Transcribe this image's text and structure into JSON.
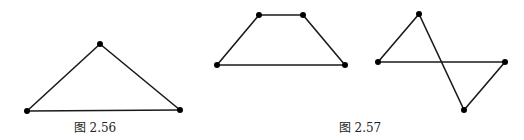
{
  "figures": [
    {
      "id": "fig-2-56",
      "caption": "图 2.56",
      "caption_pos": [
        95,
        132
      ],
      "shapes": [
        {
          "name": "triangle",
          "vertices": [
            [
              27,
              111
            ],
            [
              100,
              44
            ],
            [
              180,
              110
            ]
          ],
          "edges": [
            [
              0,
              1
            ],
            [
              1,
              2
            ],
            [
              0,
              2
            ]
          ]
        }
      ]
    },
    {
      "id": "fig-2-57",
      "caption": "图 2.57",
      "caption_pos": [
        360,
        132
      ],
      "shapes": [
        {
          "name": "trapezoid",
          "vertices": [
            [
              217,
              65
            ],
            [
              259,
              15
            ],
            [
              303,
              15
            ],
            [
              345,
              65
            ]
          ],
          "edges": [
            [
              0,
              1
            ],
            [
              1,
              2
            ],
            [
              2,
              3
            ],
            [
              0,
              3
            ]
          ]
        },
        {
          "name": "crossed-quadrilateral",
          "vertices": [
            [
              378,
              62
            ],
            [
              419,
              14
            ],
            [
              464,
              110
            ],
            [
              505,
              62
            ]
          ],
          "edges": [
            [
              0,
              1
            ],
            [
              1,
              2
            ],
            [
              2,
              3
            ],
            [
              0,
              3
            ]
          ]
        }
      ]
    }
  ],
  "style": {
    "edge_color": "#1a1a1a",
    "vertex_color": "#000000",
    "vertex_radius": 3,
    "background": "#ffffff"
  }
}
